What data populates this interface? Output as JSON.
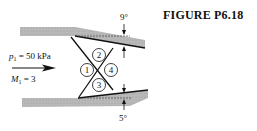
{
  "figure": {
    "title": "FIGURE P6.18",
    "inlet": {
      "pressure_label": "p",
      "pressure_sub": "1",
      "pressure_value": " = 50 kPa",
      "mach_label": "M",
      "mach_sub": "1",
      "mach_value": " = 3"
    },
    "angles": {
      "top": "9°",
      "bottom": "5°"
    },
    "regions": [
      "1",
      "2",
      "3",
      "4"
    ],
    "colors": {
      "wall": "#b4b4b4",
      "line": "#111111"
    }
  }
}
